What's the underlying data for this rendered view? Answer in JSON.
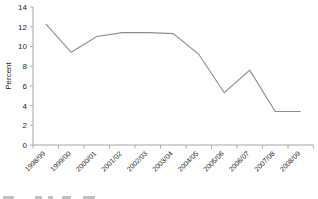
{
  "chart_data": {
    "type": "line",
    "title": "",
    "subtitle": "",
    "xlabel": "",
    "ylabel": "Percent",
    "categories": [
      "1998/99",
      "1999/00",
      "2000/01",
      "2001/02",
      "2002/03",
      "2003/04",
      "2004/05",
      "2005/06",
      "2006/07",
      "2007/08",
      "2008/09"
    ],
    "values": [
      12.3,
      9.4,
      11.0,
      11.4,
      11.4,
      11.3,
      9.2,
      5.3,
      7.6,
      3.4,
      3.4
    ],
    "series": [
      {
        "name": "",
        "values": [
          12.3,
          9.4,
          11.0,
          11.4,
          11.4,
          11.3,
          9.2,
          5.3,
          7.6,
          3.4,
          3.4
        ]
      }
    ],
    "ylim": [
      0,
      14
    ],
    "yticks": [
      0,
      2,
      4,
      6,
      8,
      10,
      12,
      14
    ],
    "grid": false,
    "legend": null,
    "xtick_rotation": -45,
    "colors": {
      "series": "#8c8c8c",
      "axis": "#9a9a9a",
      "text": "#1d1d1d",
      "background": "#ffffff"
    }
  },
  "footnote": {
    "text": "",
    "clipped": true,
    "ink_segments": [
      {
        "x": 3,
        "w": 11
      },
      {
        "x": 35,
        "w": 7
      },
      {
        "x": 48,
        "w": 5
      },
      {
        "x": 62,
        "w": 9
      },
      {
        "x": 83,
        "w": 12
      }
    ]
  }
}
